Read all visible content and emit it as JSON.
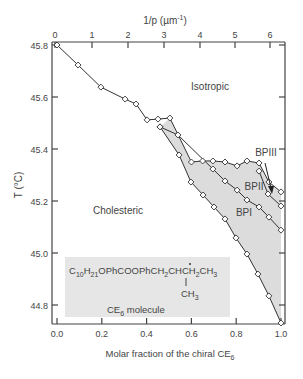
{
  "chart_data": {
    "type": "line",
    "title": "",
    "xlabel": "Molar fraction of the chiral CE6",
    "xlabel_parts": {
      "main": "Molar fraction of the chiral CE",
      "sub": "6"
    },
    "ylabel": "T (°C)",
    "top_xlabel": "1/p (µm⁻¹)",
    "xlim": [
      -0.01,
      1.02
    ],
    "ylim": [
      44.727,
      45.8
    ],
    "x_ticks": [
      "0.0",
      "0.2",
      "0.4",
      "0.6",
      "0.8",
      "1.0"
    ],
    "y_ticks": [
      "45.8",
      "45.6",
      "45.4",
      "45.2",
      "45.0",
      "44.8"
    ],
    "top_ticks": [
      "0",
      "1",
      "2",
      "3",
      "4",
      "5",
      "6"
    ],
    "grid": false,
    "legend": null,
    "region_labels": [
      "Isotropic",
      "Cholesteric",
      "BPI",
      "BPII",
      "BPIII"
    ],
    "inset": {
      "formula": "C10H21OPhCOOPhCH2CHCH2CH3",
      "branch": "CH3",
      "caption": "CE6 molecule"
    },
    "series": [
      {
        "name": "Cholesteric/Isotropic and upper BP boundary (clearing line)",
        "points": [
          [
            0.0,
            45.8
          ],
          [
            0.094,
            45.723
          ],
          [
            0.196,
            45.638
          ],
          [
            0.304,
            45.592
          ],
          [
            0.353,
            45.573
          ],
          [
            0.402,
            45.512
          ],
          [
            0.451,
            45.515
          ],
          [
            0.504,
            45.519
          ],
          [
            0.6,
            45.35
          ],
          [
            0.65,
            45.354
          ],
          [
            0.696,
            45.354
          ],
          [
            0.75,
            45.35
          ],
          [
            0.804,
            45.335
          ],
          [
            0.848,
            45.354
          ],
          [
            0.902,
            45.346
          ],
          [
            0.946,
            45.273
          ],
          [
            1.0,
            45.235
          ]
        ]
      },
      {
        "name": "BPIII/BPII boundary",
        "points": [
          [
            0.902,
            45.315
          ],
          [
            0.942,
            45.227
          ],
          [
            1.0,
            45.181
          ]
        ]
      },
      {
        "name": "BPII/BPI boundary",
        "points": [
          [
            0.46,
            45.485
          ],
          [
            0.54,
            45.454
          ],
          [
            0.696,
            45.323
          ],
          [
            0.75,
            45.277
          ],
          [
            0.804,
            45.242
          ],
          [
            0.848,
            45.204
          ],
          [
            0.902,
            45.177
          ],
          [
            0.946,
            45.138
          ],
          [
            1.0,
            45.088
          ]
        ]
      },
      {
        "name": "Cholesteric/BPI boundary",
        "points": [
          [
            0.46,
            45.485
          ],
          [
            0.545,
            45.377
          ],
          [
            0.598,
            45.273
          ],
          [
            0.652,
            45.223
          ],
          [
            0.701,
            45.177
          ],
          [
            0.75,
            45.131
          ],
          [
            0.799,
            45.058
          ],
          [
            0.848,
            44.996
          ],
          [
            0.897,
            44.919
          ],
          [
            0.946,
            44.835
          ],
          [
            1.0,
            44.731
          ]
        ]
      }
    ]
  },
  "labels": {
    "isotropic": "Isotropic",
    "cholesteric": "Cholesteric",
    "bpi": "BPI",
    "bpii": "BPII",
    "bpiii": "BPIII",
    "ylabel": "T (°C)",
    "top_label_main": "1/p (µm",
    "top_label_sup": "-1",
    "top_label_end": ")",
    "xlabel_main": "Molar fraction of the chiral CE",
    "xlabel_sub": "6",
    "inset_caption_main": "CE",
    "inset_caption_sub": "6",
    "inset_caption_end": " molecule",
    "ch3": "CH"
  }
}
